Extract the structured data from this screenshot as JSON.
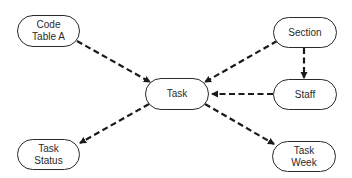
{
  "diagram": {
    "nodes": [
      {
        "id": "code_table_a",
        "label": "Code\nTable A"
      },
      {
        "id": "section",
        "label": "Section"
      },
      {
        "id": "task",
        "label": "Task"
      },
      {
        "id": "staff",
        "label": "Staff"
      },
      {
        "id": "task_status",
        "label": "Task\nStatus"
      },
      {
        "id": "task_week",
        "label": "Task\nWeek"
      }
    ],
    "edges": [
      {
        "from": "code_table_a",
        "to": "task",
        "style": "dashed"
      },
      {
        "from": "section",
        "to": "task",
        "style": "dashed"
      },
      {
        "from": "section",
        "to": "staff",
        "style": "dashed"
      },
      {
        "from": "staff",
        "to": "task",
        "style": "dashed"
      },
      {
        "from": "task",
        "to": "task_status",
        "style": "dashed"
      },
      {
        "from": "task",
        "to": "task_week",
        "style": "dashed"
      }
    ],
    "colors": {
      "stroke": "#2a2a2a",
      "background": "#ffffff"
    }
  }
}
